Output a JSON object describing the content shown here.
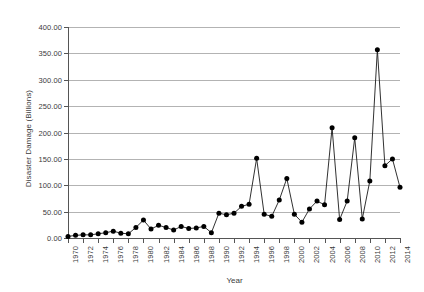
{
  "chart_data": {
    "type": "line",
    "title": "",
    "xlabel": "Year",
    "ylabel": "Disaster Damage (Billions)",
    "xlim": [
      1970,
      2014
    ],
    "ylim": [
      0,
      400
    ],
    "grid": true,
    "legend": false,
    "y_ticks": [
      "0.00",
      "50.00",
      "100.00",
      "150.00",
      "200.00",
      "250.00",
      "300.00",
      "350.00",
      "400.00"
    ],
    "y_tick_values": [
      0,
      50,
      100,
      150,
      200,
      250,
      300,
      350,
      400
    ],
    "x_ticks": [
      "1970",
      "1972",
      "1974",
      "1976",
      "1978",
      "1980",
      "1982",
      "1984",
      "1986",
      "1988",
      "1990",
      "1992",
      "1994",
      "1996",
      "1998",
      "2000",
      "2002",
      "2004",
      "2006",
      "2008",
      "2010",
      "2012",
      "2014"
    ],
    "x": [
      1970,
      1971,
      1972,
      1973,
      1974,
      1975,
      1976,
      1977,
      1978,
      1979,
      1980,
      1981,
      1982,
      1983,
      1984,
      1985,
      1986,
      1987,
      1988,
      1989,
      1990,
      1991,
      1992,
      1993,
      1994,
      1995,
      1996,
      1997,
      1998,
      1999,
      2000,
      2001,
      2002,
      2003,
      2004,
      2005,
      2006,
      2007,
      2008,
      2009,
      2010,
      2011,
      2012,
      2013,
      2014
    ],
    "values": [
      3,
      5,
      6,
      6,
      8,
      10,
      13,
      9,
      8,
      20,
      34,
      17,
      24,
      20,
      15,
      22,
      18,
      19,
      22,
      10,
      47,
      44,
      47,
      60,
      64,
      151,
      45,
      41,
      72,
      113,
      45,
      30,
      55,
      70,
      63,
      209,
      35,
      70,
      190,
      36,
      108,
      357,
      137,
      150,
      96
    ],
    "series": [
      {
        "name": "Disaster Damage",
        "values": [
          3,
          5,
          6,
          6,
          8,
          10,
          13,
          9,
          8,
          20,
          34,
          17,
          24,
          20,
          15,
          22,
          18,
          19,
          22,
          10,
          47,
          44,
          47,
          60,
          64,
          151,
          45,
          41,
          72,
          113,
          45,
          30,
          55,
          70,
          63,
          209,
          35,
          70,
          190,
          36,
          108,
          357,
          137,
          150,
          96
        ]
      }
    ],
    "marker": "filled-circle",
    "marker_color": "#000000",
    "line_color": "#1a1a1a",
    "gridline_color": "#b3b3b3",
    "background": "#ffffff"
  }
}
